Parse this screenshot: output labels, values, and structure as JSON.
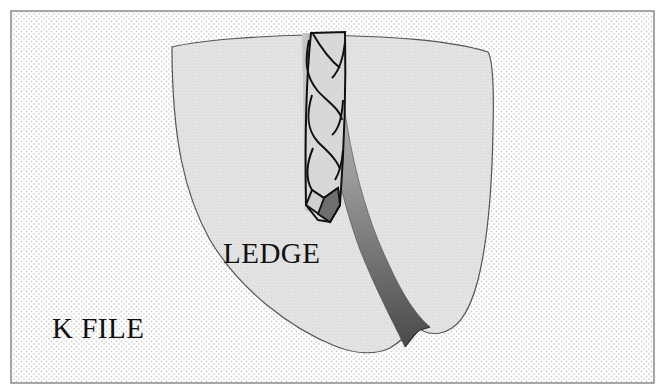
{
  "figure": {
    "labels": {
      "ledge": "LEDGE",
      "instrument": "K FILE"
    },
    "colors": {
      "background_stipple": "#d4d4d4",
      "frame_border": "#8a8a8a",
      "tooth_fill": "#e2e2e2",
      "tooth_outline": "#555555",
      "canal_light": "#b5b5b5",
      "canal_dark": "#5a5a5a",
      "file_fill": "#d6d6d6",
      "file_outline": "#111111",
      "file_tip": "#6e6e6e",
      "text": "#111111"
    }
  }
}
